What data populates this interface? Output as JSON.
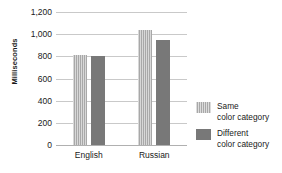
{
  "chart_data": {
    "type": "bar",
    "title": "",
    "xlabel": "",
    "ylabel": "Milliseconds",
    "categories": [
      "English",
      "Russian"
    ],
    "series": [
      {
        "name": "Same\ncolor category",
        "name_line1": "Same",
        "name_line2": "color category",
        "values": [
          810,
          1040
        ]
      },
      {
        "name": "Different\ncolor category",
        "name_line1": "Different",
        "name_line2": "color category",
        "values": [
          805,
          950
        ]
      }
    ],
    "ylim": [
      0,
      1200
    ],
    "yticks": [
      0,
      200,
      400,
      600,
      800,
      1000,
      1200
    ],
    "ytick_labels": [
      "0",
      "200",
      "400",
      "600",
      "800",
      "1,000",
      "1,200"
    ],
    "grid": true,
    "legend_position": "right",
    "colors": {
      "same": "#a8a8a8",
      "different": "#787878",
      "gridline": "#c9c9c9",
      "text": "#1a1a1a",
      "background": "#ffffff"
    }
  }
}
